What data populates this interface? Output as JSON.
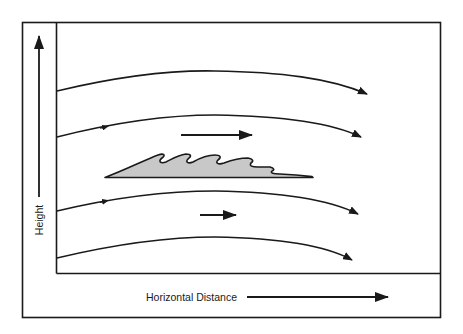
{
  "diagram": {
    "type": "airflow-over-cloud",
    "axes": {
      "y_label": "Height",
      "x_label": "Horizontal Distance"
    },
    "streamlines": [
      {
        "id": "streamline-1",
        "start": [
          57,
          91
        ],
        "peak": [
          215,
          71
        ],
        "end": [
          367,
          94
        ],
        "has_mid_arrow": false
      },
      {
        "id": "streamline-2",
        "start": [
          57,
          137
        ],
        "peak": [
          215,
          115
        ],
        "end": [
          361,
          137
        ],
        "has_mid_arrow": true
      },
      {
        "id": "streamline-3",
        "start": [
          57,
          211
        ],
        "peak": [
          215,
          191
        ],
        "end": [
          358,
          214
        ],
        "has_mid_arrow": true
      },
      {
        "id": "streamline-4",
        "start": [
          57,
          258
        ],
        "peak": [
          215,
          237
        ],
        "end": [
          352,
          260
        ],
        "has_mid_arrow": false
      }
    ],
    "wind_arrows": [
      {
        "id": "wind-arrow-upper",
        "from": [
          181,
          135
        ],
        "to": [
          252,
          135
        ],
        "meaning": "stronger wind above cloud"
      },
      {
        "id": "wind-arrow-lower",
        "from": [
          200,
          215
        ],
        "to": [
          236,
          215
        ],
        "meaning": "weaker wind below cloud"
      }
    ],
    "cloud": {
      "description": "Kelvin-Helmholtz wave cloud with breaking wave crests",
      "fill": "#c8c8c8",
      "stroke": "#1a1a1a"
    },
    "colors": {
      "line": "#1a1a1a",
      "background": "#ffffff",
      "cloud_fill": "#c8c8c8"
    }
  }
}
